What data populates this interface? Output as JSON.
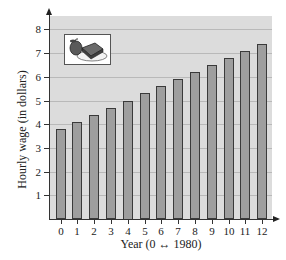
{
  "chart_data": {
    "type": "bar",
    "title": "",
    "xlabel": "Year (0 ↔ 1980)",
    "ylabel": "Hourly wage (in dollars)",
    "categories": [
      "0",
      "1",
      "2",
      "3",
      "4",
      "5",
      "6",
      "7",
      "8",
      "9",
      "10",
      "11",
      "12"
    ],
    "values": [
      3.8,
      4.1,
      4.4,
      4.7,
      5.0,
      5.3,
      5.6,
      5.9,
      6.2,
      6.5,
      6.8,
      7.1,
      7.4
    ],
    "yticks": [
      1,
      2,
      3,
      4,
      5,
      6,
      7,
      8
    ],
    "ylim": [
      0,
      8.5
    ],
    "grid": true,
    "legend": null,
    "annotations": [
      "illustration: apple and sandwich on a plate (lunch)"
    ],
    "colors": {
      "bar_fill": "#9e9e9e",
      "bar_edge": "#3a3a3a",
      "plot_bg": "#dcdcdc",
      "grid": "#b9b9b9"
    }
  },
  "labels": {
    "xlabel": "Year (0 ↔ 1980)",
    "ylabel": "Hourly wage (in dollars)"
  },
  "illustration": {
    "icon": "lunch-plate-icon"
  }
}
